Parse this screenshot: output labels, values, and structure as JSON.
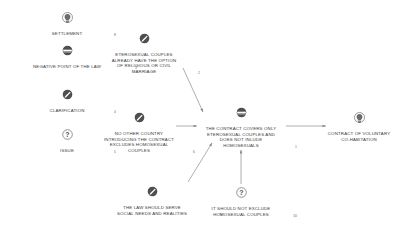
{
  "diagram": {
    "background_color": "#ffffff",
    "text_color": "#3a3a3a",
    "edge_color": "#8a8a8a",
    "icon_dark": "#4a4a4a"
  },
  "nodes": [
    {
      "id": "settlement",
      "icon": "lightbulb-icon",
      "index": "8",
      "label": "SETTLEMENT",
      "x": 67,
      "y": 12,
      "width_class": "n-narrow"
    },
    {
      "id": "negative-point-of-the-law",
      "icon": "negative-band-icon",
      "index": "3",
      "label": "NEGATIVE POINT OF THE LAW",
      "x": 67,
      "y": 45,
      "width_class": "n-wide"
    },
    {
      "id": "clarification",
      "icon": "pencil-icon",
      "index": "4",
      "label": "CLARIFICATION",
      "x": 67,
      "y": 89,
      "width_class": "n-narrow"
    },
    {
      "id": "issue",
      "icon": "question-icon",
      "index": "5",
      "label": "ISSUE",
      "x": 67,
      "y": 129,
      "width_class": "n-narrow"
    },
    {
      "id": "eterosexual-couples-option",
      "icon": "pencil-icon",
      "index": "2",
      "label": "ETEROSEXUAL COUPLES\nALREADY HAVE THE OPTION\nOF RELIGIOUS OR CIVIL\nMARRIAGE",
      "x": 144,
      "y": 33,
      "width_class": "n-mid"
    },
    {
      "id": "no-other-country",
      "icon": "pencil-icon",
      "index": "6",
      "label": "NO OTHER COUNTRY\nINTRODUCING THE CONTRACT\nEXCLUDES HOMOSEXUAL\nCOUPLES",
      "x": 139,
      "y": 112,
      "width_class": "n-mid"
    },
    {
      "id": "the-contract-covers-only",
      "icon": "negative-band-icon",
      "index": "1",
      "label": "THE CONTRACT COVERS ONLY\nETEROSEXUAL COUPLES AND\nDOES NOT INLUDE\nHOMOSEXUALS",
      "x": 241,
      "y": 107,
      "width_class": "n-mid"
    },
    {
      "id": "contract-of-voluntary-cohabitation",
      "icon": "lightbulb-icon",
      "index": "7",
      "label": "CONTRACT OF VOLUNTARY\nCO-HABITATION",
      "x": 359,
      "y": 112,
      "width_class": "n-mid"
    },
    {
      "id": "the-law-should-serve",
      "icon": "pencil-icon",
      "index": "9",
      "label": "THE LAW SHOULD SERVE\nSOCIAL NEEDS AND REALITIES",
      "x": 152,
      "y": 186,
      "width_class": "n-wide"
    },
    {
      "id": "it-should-not-exclude",
      "icon": "question-icon",
      "index": "10",
      "label": "IT SHOULD NOT EXCLUDE\nHOMOSEXUAL COUPLES",
      "x": 241,
      "y": 187,
      "width_class": "n-mid"
    }
  ],
  "edges": [
    {
      "id": "edge-eterosexual-to-contract",
      "from": "eterosexual-couples-option",
      "to": "the-contract-covers-only",
      "arrow": true
    },
    {
      "id": "edge-nocountry-to-contract",
      "from": "no-other-country",
      "to": "the-contract-covers-only",
      "arrow": true
    },
    {
      "id": "edge-contract-to-cohabitation",
      "from": "the-contract-covers-only",
      "to": "contract-of-voluntary-cohabitation",
      "arrow": true
    },
    {
      "id": "edge-lawshouldserve-to-contract",
      "from": "the-law-should-serve",
      "to": "the-contract-covers-only",
      "arrow": true
    },
    {
      "id": "edge-shouldnotexclude-to-contract",
      "from": "it-should-not-exclude",
      "to": "the-contract-covers-only",
      "arrow": true
    }
  ]
}
